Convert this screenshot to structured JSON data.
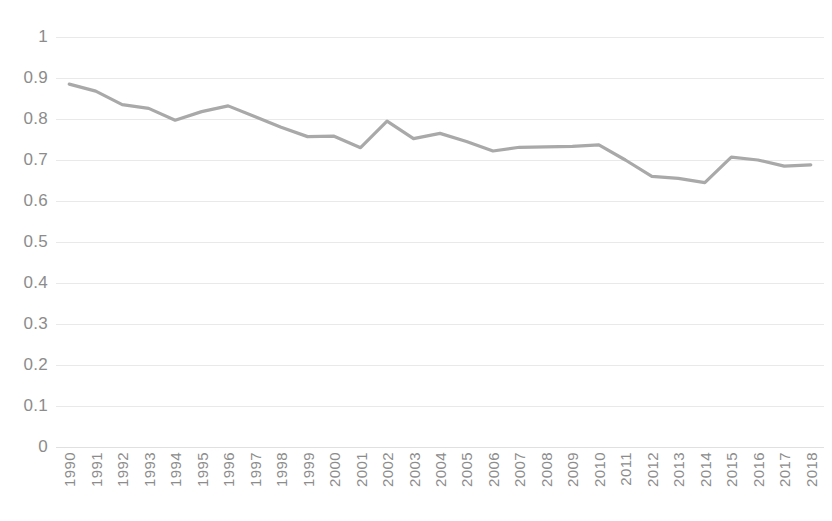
{
  "chart_data": {
    "type": "line",
    "title": "",
    "xlabel": "",
    "ylabel": "",
    "ylim": [
      0,
      1
    ],
    "ytick_labels": [
      "1",
      "0.9",
      "0.8",
      "0.7",
      "0.6",
      "0.5",
      "0.4",
      "0.3",
      "0.2",
      "0.1",
      "0"
    ],
    "ytick_values": [
      1,
      0.9,
      0.8,
      0.7,
      0.6,
      0.5,
      0.4,
      0.3,
      0.2,
      0.1,
      0
    ],
    "grid": true,
    "legend": "none",
    "series_color": "#a9a9a9",
    "categories": [
      "1990",
      "1991",
      "1992",
      "1993",
      "1994",
      "1995",
      "1996",
      "1997",
      "1998",
      "1999",
      "2000",
      "2001",
      "2002",
      "2003",
      "2004",
      "2005",
      "2006",
      "2007",
      "2008",
      "2009",
      "2010",
      "2011",
      "2012",
      "2013",
      "2014",
      "2015",
      "2016",
      "2017",
      "2018"
    ],
    "series": [
      {
        "name": "series-1",
        "values": [
          0.885,
          0.868,
          0.835,
          0.826,
          0.797,
          0.818,
          0.832,
          0.806,
          0.78,
          0.757,
          0.758,
          0.73,
          0.795,
          0.752,
          0.765,
          0.745,
          0.722,
          0.731,
          0.732,
          0.733,
          0.737,
          0.7,
          0.66,
          0.655,
          0.645,
          0.707,
          0.7,
          0.685,
          0.688
        ]
      }
    ]
  },
  "title_sliver": ""
}
